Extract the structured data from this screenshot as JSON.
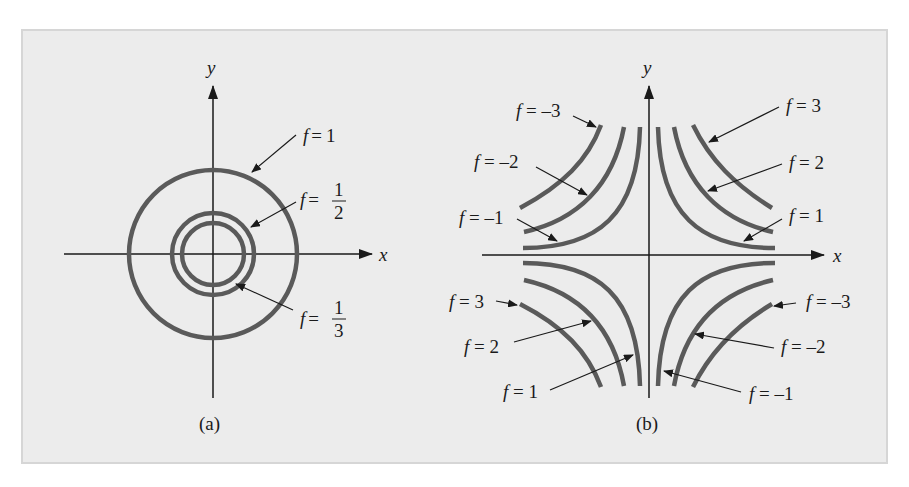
{
  "colors": {
    "background": "#ffffff",
    "panel": "#ececec",
    "panel_border": "#d6d6d6",
    "curve": "#5a5a5a",
    "axis": "#1a1a1a"
  },
  "panel_a": {
    "caption": "(a)",
    "axes": {
      "x_label": "x",
      "y_label": "y"
    },
    "level_curves": [
      {
        "f": "1",
        "label_var": "f",
        "label_eq": "=",
        "label_value": "1",
        "radius": 84
      },
      {
        "f": "1/2",
        "label_var": "f",
        "label_eq": "=",
        "num": "1",
        "den": "2",
        "radius": 41
      },
      {
        "f": "1/3",
        "label_var": "f",
        "label_eq": "=",
        "num": "1",
        "den": "3",
        "radius": 32
      }
    ]
  },
  "panel_b": {
    "caption": "(b)",
    "axes": {
      "x_label": "x",
      "y_label": "y"
    },
    "labels": {
      "tl_neg3": "f = –3",
      "tl_neg2": "f = –2",
      "tl_neg1": "f = –1",
      "tr_3": "f = 3",
      "tr_2": "f = 2",
      "tr_1": "f = 1",
      "bl_3": "f = 3",
      "bl_2": "f = 2",
      "bl_1": "f = 1",
      "br_neg3": "f = –3",
      "br_neg2": "f = –2",
      "br_neg1": "f = –1"
    }
  }
}
